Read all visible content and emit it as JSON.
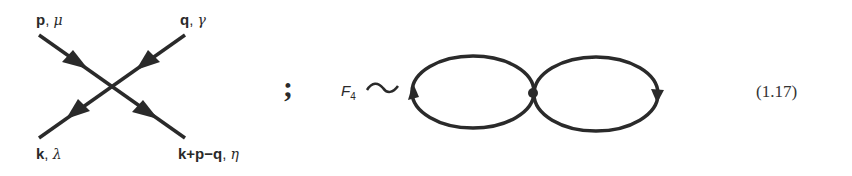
{
  "vertex_diagram": {
    "incoming_top_left": {
      "momentum": "p",
      "index": "μ"
    },
    "incoming_top_right": {
      "momentum": "q",
      "index": "γ"
    },
    "outgoing_bottom_left": {
      "momentum": "k",
      "index": "λ"
    },
    "outgoing_bottom_right": {
      "momentum": "k+p−q",
      "index": "η"
    }
  },
  "separator": ";",
  "loop_diagram": {
    "function_symbol": "F",
    "function_subscript": "4",
    "relation": "∽"
  },
  "equation_number": "(1.17)",
  "colors": {
    "ink": "#2a2a2a",
    "background": "#ffffff"
  }
}
